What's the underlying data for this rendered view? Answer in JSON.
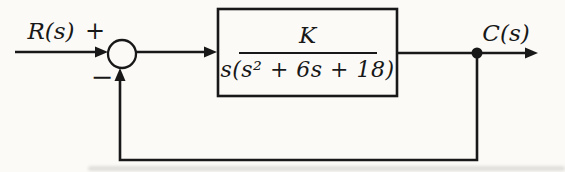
{
  "figure": {
    "type": "control-system-block-diagram",
    "input_label": "R(s)",
    "output_label": "C(s)",
    "summing_junction": {
      "plus": "+",
      "minus": "−"
    },
    "transfer_block": {
      "numerator": "K",
      "denominator": "s(s² + 6s + 18)"
    },
    "colors": {
      "ink": "#181818",
      "paper": "#fbfaf7"
    }
  }
}
